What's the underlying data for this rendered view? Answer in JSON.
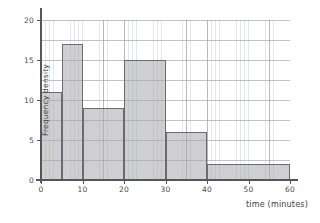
{
  "chart_data": {
    "type": "bar",
    "title": "",
    "subtitle": "",
    "xlabel": "time (minutes)",
    "ylabel": "Frequency density",
    "xlim": [
      0,
      60
    ],
    "ylim": [
      0,
      20
    ],
    "xticks": [
      0,
      10,
      20,
      30,
      40,
      50,
      60
    ],
    "yticks": [
      0,
      5,
      10,
      15,
      20
    ],
    "xtick_labels": [
      "0",
      "10",
      "20",
      "30",
      "40",
      "50",
      "60"
    ],
    "ytick_labels": [
      "0",
      "5",
      "10",
      "15",
      "20"
    ],
    "grid": true,
    "grid_style": "graph-paper minor and major gridlines",
    "legend": "none",
    "bin_edges": [
      0,
      5,
      10,
      20,
      30,
      40,
      60
    ],
    "bars": [
      {
        "label": "0-5",
        "x0": 0,
        "x1": 5,
        "value": 11
      },
      {
        "label": "5-10",
        "x0": 5,
        "x1": 10,
        "value": 17
      },
      {
        "label": "10-20",
        "x0": 10,
        "x1": 20,
        "value": 9
      },
      {
        "label": "20-30",
        "x0": 20,
        "x1": 30,
        "value": 15
      },
      {
        "label": "30-40",
        "x0": 30,
        "x1": 40,
        "value": 6
      },
      {
        "label": "40-60",
        "x0": 40,
        "x1": 60,
        "value": 2
      }
    ],
    "categories": [
      "0-5",
      "5-10",
      "10-20",
      "20-30",
      "30-40",
      "40-60"
    ],
    "values": [
      11,
      17,
      9,
      15,
      6,
      2
    ],
    "colors": {
      "bar_fill": "#a8a8ac",
      "bar_edge": "#6a6a70",
      "axis": "#55555c",
      "grid_minor": "#aaafb9",
      "grid_major": "#8c929e",
      "text": "#3e3e44",
      "background": "#ffffff"
    }
  }
}
